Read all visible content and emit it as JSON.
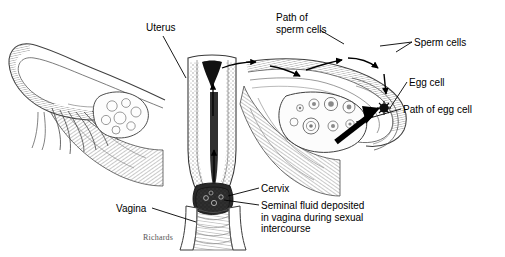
{
  "figure": {
    "background_color": "#ffffff",
    "ink_color": "#000000",
    "signature": "Richards"
  },
  "labels": {
    "uterus": "Uterus",
    "path_of_sperm_cells": "Path of\nsperm cells",
    "sperm_cells": "Sperm cells",
    "egg_cell": "Egg cell",
    "path_of_egg_cell": "Path of egg cell",
    "cervix": "Cervix",
    "seminal_fluid": "Seminal fluid deposited\nin vagina during sexual\nintercourse",
    "vagina": "Vagina"
  },
  "structures": [
    {
      "name": "left-fallopian-tube",
      "side": "left"
    },
    {
      "name": "left-fimbriae",
      "side": "left"
    },
    {
      "name": "left-ovary",
      "side": "left"
    },
    {
      "name": "left-broad-ligament",
      "side": "left"
    },
    {
      "name": "uterus-body",
      "side": "center"
    },
    {
      "name": "uterine-cavity",
      "side": "center"
    },
    {
      "name": "cervical-canal",
      "side": "center"
    },
    {
      "name": "cervix",
      "side": "center"
    },
    {
      "name": "vaginal-canal",
      "side": "center"
    },
    {
      "name": "seminal-fluid-pool",
      "side": "center"
    },
    {
      "name": "right-fallopian-tube",
      "side": "right"
    },
    {
      "name": "right-ovary",
      "side": "right"
    },
    {
      "name": "ovarian-follicles",
      "side": "right"
    },
    {
      "name": "egg-cell",
      "side": "right"
    },
    {
      "name": "right-broad-ligament",
      "side": "right"
    }
  ]
}
